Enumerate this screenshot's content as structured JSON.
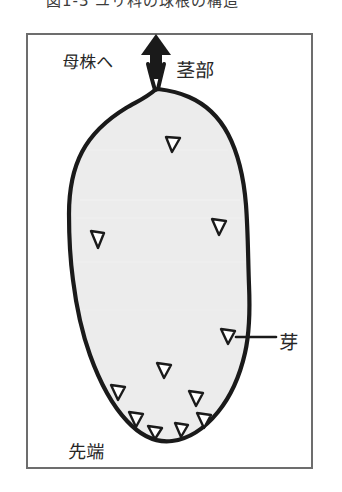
{
  "caption": {
    "text": "図1-3  ユリ科の球根の構造"
  },
  "figure": {
    "name": "lily-bulb-cross-section",
    "frame_color": "#6d6d6d",
    "bulb_fill_color": "#ececec",
    "bulb_outline_color": "#1a1a1a",
    "labels": {
      "mother_plant": "母株へ",
      "stem": "茎部",
      "bud": "芽",
      "tip": "先端"
    },
    "arrow": {
      "name": "up-arrow-icon",
      "direction": "up",
      "color": "#1a1a1a"
    },
    "bud_markers": {
      "shape": "downward-triangle-outline",
      "count": 11,
      "color": "#1a1a1a",
      "positions": [
        {
          "x": 173,
          "y": 144
        },
        {
          "x": 97,
          "y": 239
        },
        {
          "x": 219,
          "y": 227
        },
        {
          "x": 228,
          "y": 336
        },
        {
          "x": 164,
          "y": 370
        },
        {
          "x": 118,
          "y": 392
        },
        {
          "x": 196,
          "y": 398
        },
        {
          "x": 136,
          "y": 419
        },
        {
          "x": 204,
          "y": 420
        },
        {
          "x": 155,
          "y": 432
        },
        {
          "x": 181,
          "y": 429
        }
      ]
    },
    "leader_line": {
      "name": "bud-leader-line",
      "from": {
        "x": 236,
        "y": 337
      },
      "to": {
        "x": 276,
        "y": 337
      }
    }
  }
}
